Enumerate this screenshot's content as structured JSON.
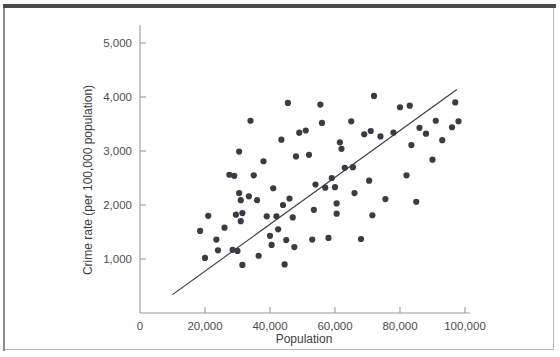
{
  "figure": {
    "background_color": "#ffffff",
    "frame_color": "#b9b9b9",
    "top_rule_color": "#4a4a4a"
  },
  "chart_data": {
    "type": "scatter",
    "title": "",
    "subtitle": "",
    "xlabel": "Population",
    "ylabel": "Crime rate (per 100,000 population)",
    "xlim": [
      0,
      108000
    ],
    "ylim": [
      0,
      5400
    ],
    "grid": false,
    "legend": null,
    "legend_position": "none",
    "x_ticks": [
      0,
      20000,
      40000,
      60000,
      80000,
      100000
    ],
    "x_tick_labels": [
      "0",
      "20,000",
      "40,000",
      "60,000",
      "80,000",
      "100,000"
    ],
    "y_ticks": [
      1000,
      2000,
      3000,
      4000,
      5000
    ],
    "y_tick_labels": [
      "1,000",
      "2,000",
      "3,000",
      "4,000",
      "5,000"
    ],
    "marker": {
      "shape": "circle",
      "color": "#3b3b45",
      "size_px": 3.1
    },
    "trend_line": {
      "label": "least-squares regression line",
      "color": "#3b3b45",
      "width_px": 1.15,
      "x_start": 10000,
      "y_start": 340,
      "x_end": 97500,
      "y_end": 4140
    },
    "points": [
      [
        18500,
        1520
      ],
      [
        20000,
        1020
      ],
      [
        21000,
        1800
      ],
      [
        23500,
        1360
      ],
      [
        24000,
        1160
      ],
      [
        26000,
        1580
      ],
      [
        27500,
        2560
      ],
      [
        28500,
        1170
      ],
      [
        29000,
        2540
      ],
      [
        29500,
        1820
      ],
      [
        30000,
        1150
      ],
      [
        30500,
        2220
      ],
      [
        30500,
        2990
      ],
      [
        31000,
        2090
      ],
      [
        31000,
        1700
      ],
      [
        31500,
        1850
      ],
      [
        31500,
        890
      ],
      [
        33500,
        2160
      ],
      [
        34000,
        3560
      ],
      [
        35000,
        2550
      ],
      [
        36000,
        2090
      ],
      [
        36500,
        1060
      ],
      [
        38000,
        2810
      ],
      [
        39000,
        1790
      ],
      [
        40000,
        1430
      ],
      [
        40500,
        1260
      ],
      [
        41000,
        2310
      ],
      [
        42000,
        1790
      ],
      [
        42500,
        1550
      ],
      [
        43500,
        3210
      ],
      [
        44000,
        2000
      ],
      [
        44500,
        900
      ],
      [
        45000,
        1350
      ],
      [
        45500,
        3890
      ],
      [
        46000,
        2120
      ],
      [
        47000,
        1770
      ],
      [
        47500,
        1220
      ],
      [
        48000,
        2900
      ],
      [
        49000,
        3340
      ],
      [
        51000,
        3380
      ],
      [
        52000,
        2930
      ],
      [
        53000,
        1360
      ],
      [
        53500,
        1910
      ],
      [
        54000,
        2380
      ],
      [
        55500,
        3860
      ],
      [
        56000,
        3520
      ],
      [
        57000,
        2320
      ],
      [
        58000,
        1390
      ],
      [
        59000,
        2500
      ],
      [
        60000,
        2330
      ],
      [
        60500,
        1840
      ],
      [
        60500,
        2030
      ],
      [
        61500,
        3160
      ],
      [
        62000,
        3040
      ],
      [
        63000,
        2690
      ],
      [
        65000,
        3550
      ],
      [
        65500,
        2700
      ],
      [
        66000,
        2220
      ],
      [
        68000,
        1370
      ],
      [
        69000,
        3310
      ],
      [
        70500,
        2450
      ],
      [
        71000,
        3370
      ],
      [
        71500,
        1810
      ],
      [
        72000,
        4020
      ],
      [
        74000,
        3270
      ],
      [
        75500,
        2110
      ],
      [
        78000,
        3340
      ],
      [
        80000,
        3810
      ],
      [
        82000,
        2550
      ],
      [
        83000,
        3840
      ],
      [
        83500,
        3110
      ],
      [
        85000,
        2060
      ],
      [
        86000,
        3430
      ],
      [
        88000,
        3320
      ],
      [
        90000,
        2840
      ],
      [
        91000,
        3560
      ],
      [
        93000,
        3200
      ],
      [
        96000,
        3440
      ],
      [
        97000,
        3900
      ],
      [
        98000,
        3550
      ]
    ]
  }
}
